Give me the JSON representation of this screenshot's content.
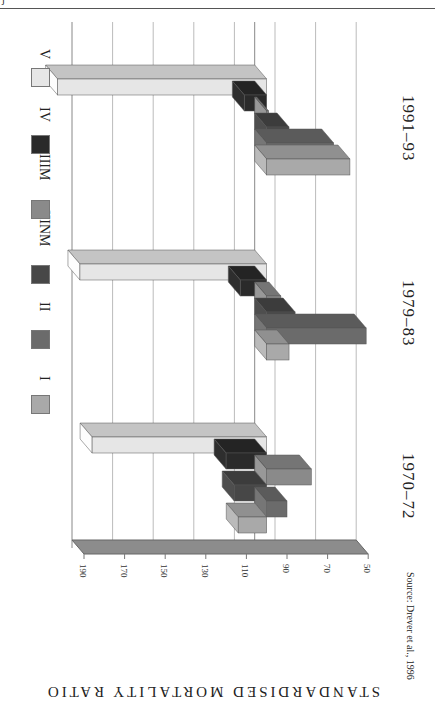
{
  "page": {
    "header_mark": "j"
  },
  "source_note": "Source: Drever et al., 1996",
  "chart_data": {
    "type": "bar",
    "orientation": "horizontal (rotated 90°, 3D)",
    "title": "",
    "ylabel": "STANDARDISED MORTALITY RATIO",
    "xlabel": "",
    "baseline": 100,
    "ylim": [
      50,
      190
    ],
    "ticks": [
      190,
      170,
      150,
      130,
      110,
      90,
      70,
      50
    ],
    "categories": [
      "1970–72",
      "1979–83",
      "1991–93"
    ],
    "series": [
      {
        "name": "I",
        "color": "#a9a9a9",
        "values": [
          114,
          89,
          59
        ]
      },
      {
        "name": "II",
        "color": "#6b6b6b",
        "values": [
          90,
          51,
          67
        ]
      },
      {
        "name": "IIINM",
        "color": "#474747",
        "values": [
          116,
          86,
          89
        ]
      },
      {
        "name": "IIIM",
        "color": "#8a8a8a",
        "values": [
          78,
          93,
          99
        ]
      },
      {
        "name": "IV",
        "color": "#2a2a2a",
        "values": [
          120,
          113,
          111
        ]
      },
      {
        "name": "V",
        "color": "#e6e6e6",
        "values": [
          186,
          192,
          203
        ]
      }
    ],
    "legend_position": "left (rotated)",
    "grid": true
  }
}
